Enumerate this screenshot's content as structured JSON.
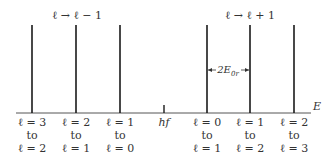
{
  "diagram": {
    "axis": {
      "label": "E"
    },
    "groups": [
      {
        "label": "ℓ → ℓ − 1",
        "center_x": 77
      },
      {
        "label": "ℓ → ℓ + 1",
        "center_x": 250
      }
    ],
    "dimension": {
      "label": "2E0r",
      "base": "2E",
      "subscript": "0r"
    },
    "center_tick": {
      "label": "hf"
    },
    "lines": [
      {
        "x": 32,
        "from": "ℓ = 3",
        "to_word": "to",
        "to": "ℓ = 2"
      },
      {
        "x": 76,
        "from": "ℓ = 2",
        "to_word": "to",
        "to": "ℓ = 1"
      },
      {
        "x": 120,
        "from": "ℓ = 1",
        "to_word": "to",
        "to": "ℓ = 0"
      },
      {
        "x": 207,
        "from": "ℓ = 0",
        "to_word": "to",
        "to": "ℓ = 1"
      },
      {
        "x": 250,
        "from": "ℓ = 1",
        "to_word": "to",
        "to": "ℓ = 2"
      },
      {
        "x": 294,
        "from": "ℓ = 2",
        "to_word": "to",
        "to": "ℓ = 3"
      }
    ],
    "colors": {
      "line": "#1a1a1a",
      "axis": "#555555",
      "text": "#333333"
    }
  }
}
